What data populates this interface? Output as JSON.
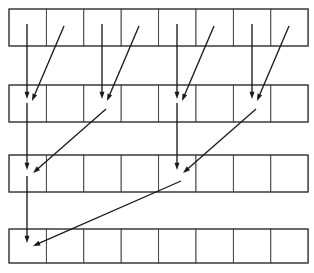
{
  "figure": {
    "canvas": {
      "width": 314,
      "height": 273
    },
    "background_color": "#ffffff",
    "line_color": "#3b3b3b",
    "arrow_color": "#1a1a1a"
  },
  "grid": {
    "rows_count": 4,
    "cells_per_row": 8,
    "left": 9,
    "right": 308,
    "cell_width": 37.4,
    "row_height": 37,
    "rows": [
      {
        "index": 0,
        "label": "row-1",
        "top": 9,
        "bottom": 46
      },
      {
        "index": 1,
        "label": "row-2",
        "top": 85,
        "bottom": 122
      },
      {
        "index": 2,
        "label": "row-3",
        "top": 155,
        "bottom": 192
      },
      {
        "index": 3,
        "label": "row-4",
        "top": 229,
        "bottom": 263
      }
    ],
    "column_edges": [
      9,
      46.4,
      83.8,
      121.2,
      158.6,
      196,
      233.4,
      270.8,
      308.2
    ]
  },
  "arrows": [
    {
      "name": "arrow-v-r1c1-to-r2c1",
      "kind": "vertical",
      "from_row": 1,
      "from_cell": 1,
      "to_row": 2,
      "to_cell": 1,
      "x1": 27,
      "y1": 24,
      "x2": 27,
      "y2": 99
    },
    {
      "name": "arrow-d-r1c2-to-r2c1",
      "kind": "diagonal",
      "from_row": 1,
      "from_cell": 2,
      "to_row": 2,
      "to_cell": 1,
      "x1": 64,
      "y1": 26,
      "x2": 32,
      "y2": 101
    },
    {
      "name": "arrow-v-r1c3-to-r2c3",
      "kind": "vertical",
      "from_row": 1,
      "from_cell": 3,
      "to_row": 2,
      "to_cell": 3,
      "x1": 102,
      "y1": 24,
      "x2": 102,
      "y2": 99
    },
    {
      "name": "arrow-d-r1c4-to-r2c3",
      "kind": "diagonal",
      "from_row": 1,
      "from_cell": 4,
      "to_row": 2,
      "to_cell": 3,
      "x1": 139,
      "y1": 26,
      "x2": 107,
      "y2": 101
    },
    {
      "name": "arrow-v-r1c5-to-r2c5",
      "kind": "vertical",
      "from_row": 1,
      "from_cell": 5,
      "to_row": 2,
      "to_cell": 5,
      "x1": 177,
      "y1": 24,
      "x2": 177,
      "y2": 99
    },
    {
      "name": "arrow-d-r1c6-to-r2c5",
      "kind": "diagonal",
      "from_row": 1,
      "from_cell": 6,
      "to_row": 2,
      "to_cell": 5,
      "x1": 214,
      "y1": 26,
      "x2": 182,
      "y2": 101
    },
    {
      "name": "arrow-v-r1c7-to-r2c7",
      "kind": "vertical",
      "from_row": 1,
      "from_cell": 7,
      "to_row": 2,
      "to_cell": 7,
      "x1": 252,
      "y1": 24,
      "x2": 252,
      "y2": 99
    },
    {
      "name": "arrow-d-r1c8-to-r2c7",
      "kind": "diagonal",
      "from_row": 1,
      "from_cell": 8,
      "to_row": 2,
      "to_cell": 7,
      "x1": 289,
      "y1": 26,
      "x2": 257,
      "y2": 101
    },
    {
      "name": "arrow-v-r2c1-to-r3c1",
      "kind": "vertical",
      "from_row": 2,
      "from_cell": 1,
      "to_row": 3,
      "to_cell": 1,
      "x1": 27,
      "y1": 103,
      "x2": 27,
      "y2": 170
    },
    {
      "name": "arrow-d-r2c3-to-r3c1",
      "kind": "diagonal",
      "from_row": 2,
      "from_cell": 3,
      "to_row": 3,
      "to_cell": 1,
      "x1": 106,
      "y1": 109,
      "x2": 33,
      "y2": 173
    },
    {
      "name": "arrow-v-r2c5-to-r3c5",
      "kind": "vertical",
      "from_row": 2,
      "from_cell": 5,
      "to_row": 3,
      "to_cell": 5,
      "x1": 177,
      "y1": 103,
      "x2": 177,
      "y2": 170
    },
    {
      "name": "arrow-d-r2c7-to-r3c5",
      "kind": "diagonal",
      "from_row": 2,
      "from_cell": 7,
      "to_row": 3,
      "to_cell": 5,
      "x1": 256,
      "y1": 109,
      "x2": 183,
      "y2": 173
    },
    {
      "name": "arrow-v-r3c1-to-r4c1",
      "kind": "vertical",
      "from_row": 3,
      "from_cell": 1,
      "to_row": 4,
      "to_cell": 1,
      "x1": 27,
      "y1": 176,
      "x2": 27,
      "y2": 243
    },
    {
      "name": "arrow-d-r3c5-to-r4c1",
      "kind": "diagonal",
      "from_row": 3,
      "from_cell": 5,
      "to_row": 4,
      "to_cell": 1,
      "x1": 181,
      "y1": 181,
      "x2": 33,
      "y2": 246
    }
  ]
}
